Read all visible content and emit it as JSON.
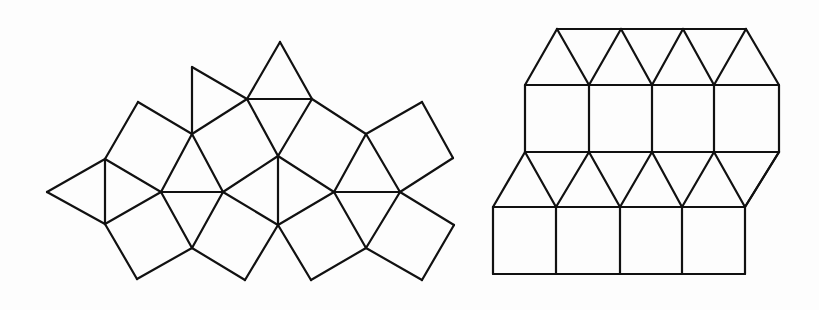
{
  "figures": [
    {
      "id": "left-tiling",
      "description": "Snub-square-like tiling patch of squares and equilateral triangles",
      "vertices": {
        "A": [
          47,
          192
        ],
        "B": [
          105,
          159
        ],
        "C": [
          105,
          224
        ],
        "D": [
          138,
          102
        ],
        "E": [
          192,
          134
        ],
        "F": [
          192,
          67
        ],
        "G": [
          161,
          192
        ],
        "H": [
          223,
          192
        ],
        "I": [
          247,
          99
        ],
        "J": [
          312,
          99
        ],
        "K": [
          280,
          42
        ],
        "L": [
          278,
          156
        ],
        "M": [
          278,
          225
        ],
        "N": [
          192,
          248
        ],
        "O": [
          137,
          279
        ],
        "P": [
          245,
          280
        ],
        "Q": [
          366,
          134
        ],
        "R": [
          422,
          102
        ],
        "S": [
          453,
          158
        ],
        "T": [
          334,
          192
        ],
        "U": [
          400,
          192
        ],
        "V": [
          366,
          248
        ],
        "W": [
          311,
          280
        ],
        "X": [
          422,
          280
        ],
        "Y": [
          454,
          225
        ]
      },
      "edges": [
        [
          "A",
          "B"
        ],
        [
          "A",
          "C"
        ],
        [
          "B",
          "C"
        ],
        [
          "B",
          "D"
        ],
        [
          "D",
          "E"
        ],
        [
          "E",
          "G"
        ],
        [
          "B",
          "G"
        ],
        [
          "C",
          "G"
        ],
        [
          "E",
          "F"
        ],
        [
          "F",
          "I"
        ],
        [
          "E",
          "I"
        ],
        [
          "I",
          "K"
        ],
        [
          "K",
          "J"
        ],
        [
          "I",
          "J"
        ],
        [
          "E",
          "H"
        ],
        [
          "G",
          "H"
        ],
        [
          "I",
          "L"
        ],
        [
          "J",
          "L"
        ],
        [
          "H",
          "L"
        ],
        [
          "J",
          "Q"
        ],
        [
          "L",
          "T"
        ],
        [
          "Q",
          "T"
        ],
        [
          "Q",
          "R"
        ],
        [
          "R",
          "S"
        ],
        [
          "S",
          "U"
        ],
        [
          "Q",
          "U"
        ],
        [
          "T",
          "U"
        ],
        [
          "L",
          "M"
        ],
        [
          "H",
          "M"
        ],
        [
          "M",
          "T"
        ],
        [
          "G",
          "N"
        ],
        [
          "H",
          "N"
        ],
        [
          "C",
          "O"
        ],
        [
          "N",
          "O"
        ],
        [
          "N",
          "P"
        ],
        [
          "P",
          "M"
        ],
        [
          "M",
          "W"
        ],
        [
          "W",
          "V"
        ],
        [
          "V",
          "T"
        ],
        [
          "U",
          "V"
        ],
        [
          "V",
          "X"
        ],
        [
          "X",
          "Y"
        ],
        [
          "Y",
          "U"
        ]
      ]
    },
    {
      "id": "right-tiling",
      "description": "Elongated triangular tiling patch: alternating rows of triangles and squares",
      "rows": {
        "top": {
          "y": 29,
          "x": [
            557,
            621,
            683,
            746
          ]
        },
        "upper": {
          "y": 85,
          "x": [
            525,
            589,
            652,
            714,
            779
          ]
        },
        "middle": {
          "y": 152,
          "x": [
            525,
            589,
            652,
            714,
            779
          ]
        },
        "lower": {
          "y": 207,
          "x": [
            493,
            556,
            620,
            682,
            745
          ]
        },
        "bottom": {
          "y": 274,
          "x": [
            493,
            556,
            620,
            682,
            745
          ]
        }
      }
    }
  ],
  "colors": {
    "stroke": "#111111",
    "background": "#fdfdfd"
  }
}
